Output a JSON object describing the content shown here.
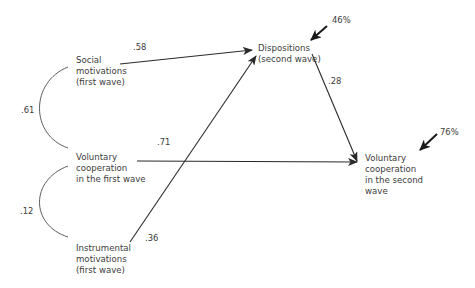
{
  "diagram": {
    "type": "path-model",
    "nodes": {
      "social": {
        "lines": [
          "Social",
          "motivations",
          "(first wave)"
        ]
      },
      "vc1": {
        "lines": [
          "Voluntary",
          "cooperation",
          "in the first wave"
        ]
      },
      "instrumental": {
        "lines": [
          "Instrumental",
          "motivations",
          "(first wave)"
        ]
      },
      "dispositions": {
        "lines": [
          "Dispositions",
          "(second wave)"
        ]
      },
      "vc2": {
        "lines": [
          "Voluntary",
          "cooperation",
          "in the second",
          "wave"
        ]
      }
    },
    "paths": {
      "social_to_dispositions": ".58",
      "dispositions_to_vc2": ".28",
      "vc1_to_vc2": ".71",
      "instrumental_to_dispositions": ".36"
    },
    "correlations": {
      "social_vc1": ".61",
      "vc1_instrumental": ".12"
    },
    "variance_explained": {
      "dispositions": "46%",
      "vc2": "76%"
    },
    "colors": {
      "line": "#2a2a2a",
      "text": "#3c3c3c"
    }
  }
}
